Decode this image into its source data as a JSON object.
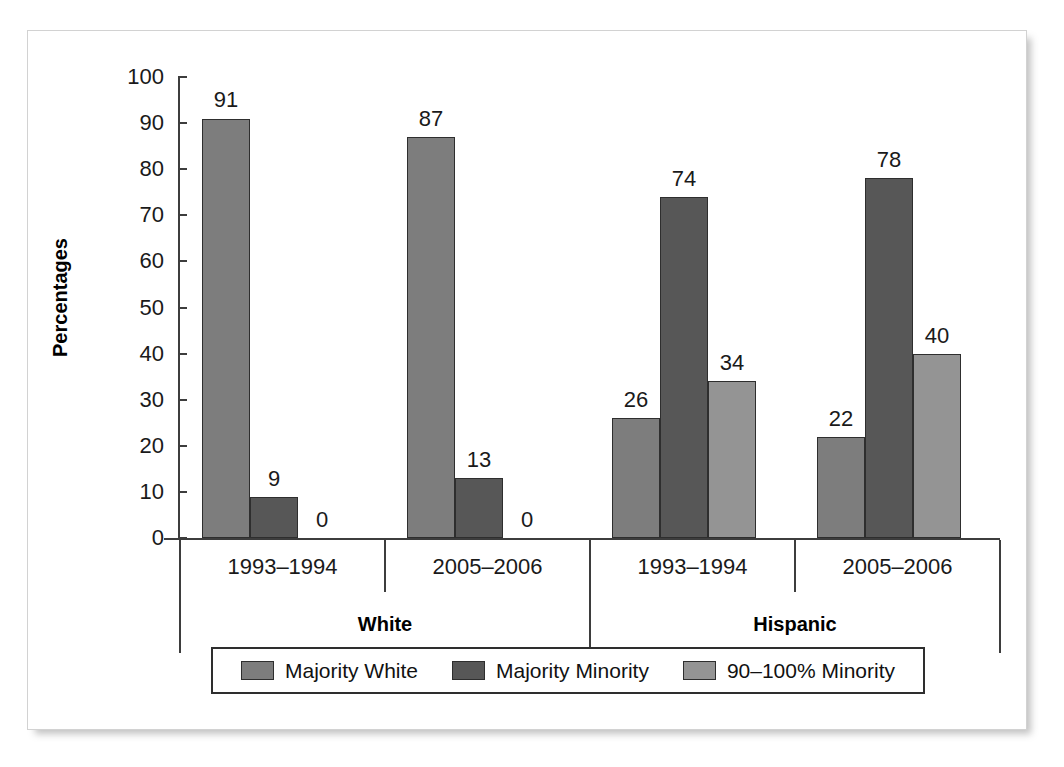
{
  "chart_data": {
    "type": "bar",
    "title": "",
    "subtitle": "",
    "xlabel": "",
    "ylabel": "Percentages",
    "ylim": [
      0,
      100
    ],
    "ytick_step": 10,
    "ytick_labels": [
      "100",
      "90",
      "80",
      "70",
      "60",
      "50",
      "40",
      "30",
      "20",
      "10",
      "0"
    ],
    "grid": false,
    "legend_position": "bottom",
    "categories": [
      "1993–1994",
      "2005–2006",
      "1993–1994",
      "2005–2006"
    ],
    "supergroups": [
      {
        "label": "White",
        "categories": [
          "1993–1994",
          "2005–2006"
        ]
      },
      {
        "label": "Hispanic",
        "categories": [
          "1993–1994",
          "2005–2006"
        ]
      }
    ],
    "series": [
      {
        "name": "Majority White",
        "color": "#7d7d7d",
        "values": [
          91,
          87,
          26,
          22
        ]
      },
      {
        "name": "Majority Minority",
        "color": "#575757",
        "values": [
          9,
          13,
          74,
          78
        ]
      },
      {
        "name": "90–100% Minority",
        "color": "#949494",
        "values": [
          0,
          0,
          34,
          40
        ]
      }
    ],
    "data_labels": [
      {
        "group": 0,
        "series": 0,
        "text": "91"
      },
      {
        "group": 0,
        "series": 1,
        "text": "9"
      },
      {
        "group": 0,
        "series": 2,
        "text": "0"
      },
      {
        "group": 1,
        "series": 0,
        "text": "87"
      },
      {
        "group": 1,
        "series": 1,
        "text": "13"
      },
      {
        "group": 1,
        "series": 2,
        "text": "0"
      },
      {
        "group": 2,
        "series": 0,
        "text": "26"
      },
      {
        "group": 2,
        "series": 1,
        "text": "74"
      },
      {
        "group": 2,
        "series": 2,
        "text": "34"
      },
      {
        "group": 3,
        "series": 0,
        "text": "22"
      },
      {
        "group": 3,
        "series": 1,
        "text": "78"
      },
      {
        "group": 3,
        "series": 2,
        "text": "40"
      }
    ]
  },
  "axis": {
    "y_title": "Percentages",
    "y_ticks": [
      "100",
      "90",
      "80",
      "70",
      "60",
      "50",
      "40",
      "30",
      "20",
      "10",
      "0"
    ]
  },
  "legend": {
    "items": [
      {
        "label": "Majority White",
        "color": "#7d7d7d"
      },
      {
        "label": "Majority Minority",
        "color": "#575757"
      },
      {
        "label": "90–100% Minority",
        "color": "#949494"
      }
    ]
  },
  "groups": {
    "periods": [
      "1993–1994",
      "2005–2006",
      "1993–1994",
      "2005–2006"
    ],
    "ethnicities": [
      "White",
      "Hispanic"
    ]
  },
  "colors": {
    "majority_white": "#7d7d7d",
    "majority_minority": "#575757",
    "ninety_to_hundred_minority": "#949494",
    "axis": "#3d3d3d",
    "text": "#1a1a1a",
    "frame": "#d2d2d2"
  }
}
